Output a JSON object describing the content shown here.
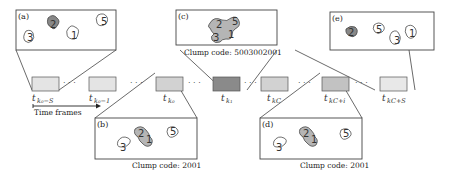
{
  "figure": {
    "panels": [
      {
        "id": "a",
        "label": "(a)",
        "caption": "",
        "clumps": [
          "2",
          "1",
          "3",
          "5"
        ],
        "merged_label": ""
      },
      {
        "id": "b",
        "label": "(b)",
        "caption": "Clump code: 2001",
        "clumps": [
          "3",
          "2",
          "1",
          "5"
        ]
      },
      {
        "id": "c",
        "label": "(c)",
        "caption": "Clump code: 5003002001",
        "clumps": [
          "2",
          "5",
          "3",
          "1"
        ]
      },
      {
        "id": "d",
        "label": "(d)",
        "caption": "Clump code: 2001",
        "clumps": [
          "3",
          "2",
          "1",
          "5"
        ]
      },
      {
        "id": "e",
        "label": "(e)",
        "caption": "",
        "clumps": [
          "2",
          "5",
          "3",
          "1"
        ]
      }
    ],
    "timeline": {
      "frames": [
        {
          "id": "f1",
          "t": "t",
          "sub": "k₀−S",
          "shade": "#e4e4e4"
        },
        {
          "id": "f2",
          "t": "t",
          "sub": "k₀−1",
          "shade": "#e4e4e4"
        },
        {
          "id": "f3",
          "t": "t",
          "sub": "k₀",
          "shade": "#d2d2d2"
        },
        {
          "id": "f4",
          "t": "t",
          "sub": "k₁",
          "shade": "#8a8a8a"
        },
        {
          "id": "f5",
          "t": "t",
          "sub": "kC",
          "shade": "#d2d2d2"
        },
        {
          "id": "f6",
          "t": "t",
          "sub": "kC+i",
          "shade": "#c2c2c2"
        },
        {
          "id": "f7",
          "t": "t",
          "sub": "kC+S",
          "shade": "#e8e8e8"
        }
      ],
      "ellipsis": "· · ·",
      "axis_label": "Time frames"
    },
    "colors": {
      "clump_fill_merged": "#b5b5b5",
      "clump_fill_single": "#ffffff",
      "frame_border": "#555555",
      "line": "#444444"
    }
  }
}
